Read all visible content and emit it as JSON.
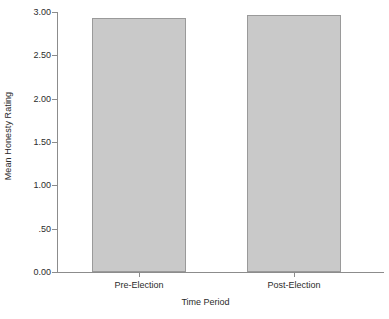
{
  "chart_data": {
    "type": "bar",
    "title": "",
    "subtitle": "",
    "xlabel": "Time Period",
    "ylabel": "Mean Honesty Rating",
    "categories": [
      "Pre-Election",
      "Post-Election"
    ],
    "values": [
      2.93,
      2.97
    ],
    "ylim": [
      0.0,
      3.0
    ],
    "xlim_note": "categorical",
    "yticks": [
      0.0,
      0.5,
      1.0,
      1.5,
      2.0,
      2.5,
      3.0
    ],
    "ytick_labels": [
      "0.00",
      ".50",
      "1.00",
      "1.50",
      "2.00",
      "2.50",
      "3.00"
    ],
    "grid": false,
    "legend": null,
    "legend_position": "none",
    "annotations": [],
    "series": [
      {
        "name": "Mean Honesty Rating",
        "values": [
          2.93,
          2.97
        ]
      }
    ],
    "colors": {
      "bar_fill": "#c9c9c9",
      "bar_border": "#9a9a9a",
      "axis": "#8c8c8c",
      "text": "#2b2b2b",
      "background": "#ffffff"
    }
  },
  "axes": {
    "y_title": "Mean Honesty Rating",
    "x_title": "Time Period"
  },
  "ticks": {
    "y": [
      {
        "label": "3.00",
        "value": 3.0
      },
      {
        "label": "2.50",
        "value": 2.5
      },
      {
        "label": "2.00",
        "value": 2.0
      },
      {
        "label": "1.50",
        "value": 1.5
      },
      {
        "label": "1.00",
        "value": 1.0
      },
      {
        "label": ".50",
        "value": 0.5
      },
      {
        "label": "0.00",
        "value": 0.0
      }
    ],
    "x": [
      {
        "label": "Pre-Election"
      },
      {
        "label": "Post-Election"
      }
    ]
  }
}
